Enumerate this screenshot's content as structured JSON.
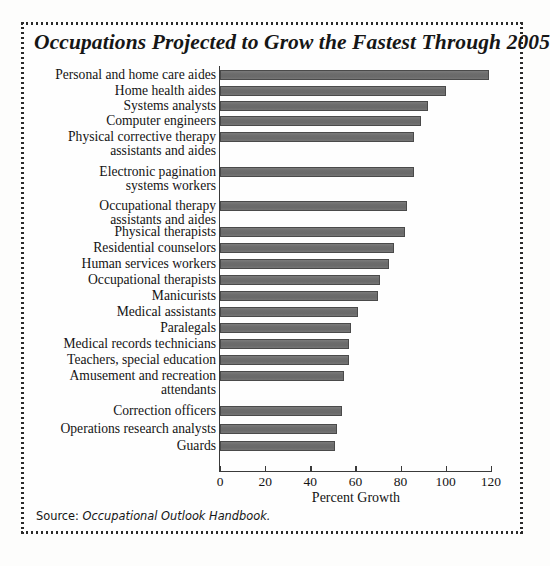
{
  "figure": {
    "title": "Occupations Projected to Grow the Fastest Through 2005",
    "source_prefix": "Source: ",
    "source_reference": "Occupational Outlook Handbook.",
    "frame_style": "dotted-border",
    "bar_color": "#6f6f6f",
    "bar_edge_color": "#4a4a4a",
    "axis_color": "#3a3a3a",
    "background_color": "#fefefe"
  },
  "chart_data": {
    "type": "bar",
    "orientation": "horizontal",
    "title": "Occupations Projected to Grow the Fastest Through 2005",
    "xlabel": "Percent Growth",
    "ylabel": "",
    "xlim": [
      0,
      120
    ],
    "xticks": [
      0,
      20,
      40,
      60,
      80,
      100,
      120
    ],
    "grid": false,
    "legend": false,
    "categories": [
      "Personal and home care aides",
      "Home health aides",
      "Systems analysts",
      "Computer engineers",
      "Physical corrective therapy\nassistants and aides",
      "Electronic pagination\nsystems workers",
      "Occupational therapy\nassistants and aides",
      "Physical therapists",
      "Residential counselors",
      "Human services workers",
      "Occupational therapists",
      "Manicurists",
      "Medical assistants",
      "Paralegals",
      "Medical records technicians",
      "Teachers, special education",
      "Amusement and recreation\nattendants",
      "Correction officers",
      "Operations research analysts",
      "Guards"
    ],
    "values": [
      119,
      100,
      92,
      89,
      86,
      86,
      83,
      82,
      77,
      75,
      71,
      70,
      61,
      58,
      57,
      57,
      55,
      54,
      52,
      51
    ]
  }
}
